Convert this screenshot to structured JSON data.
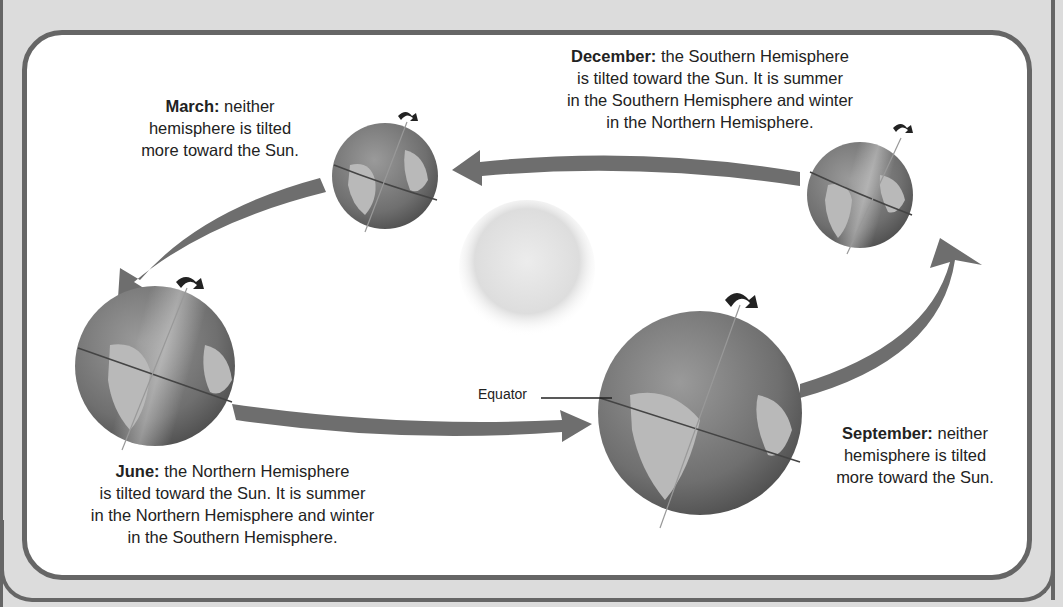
{
  "title_cut_off": "",
  "diagram": {
    "colors": {
      "frame_background": "#dcdcdc",
      "frame_border": "#666666",
      "panel_background": "#ffffff",
      "arrow": "#6e6e6e",
      "globe_ocean": "#7a7a7a",
      "globe_land": "#b9b9b9",
      "sun": "#e4e4e4",
      "text": "#222222"
    },
    "sun": {
      "label": "Sun"
    },
    "equator_label": "Equator",
    "seasons": [
      {
        "month": "March:",
        "text_lines": [
          "neither",
          "hemisphere is tilted",
          "more toward the Sun."
        ]
      },
      {
        "month": "June:",
        "text_lines": [
          "the Northern Hemisphere",
          "is tilted toward the Sun. It is summer",
          "in the Northern Hemisphere and winter",
          "in the Southern Hemisphere."
        ]
      },
      {
        "month": "September:",
        "text_lines": [
          "neither",
          "hemisphere is tilted",
          "more toward the Sun."
        ]
      },
      {
        "month": "December:",
        "text_lines": [
          "the Southern Hemisphere",
          "is tilted toward the Sun. It is summer",
          "in the Southern Hemisphere and winter",
          "in the Northern Hemisphere."
        ]
      }
    ],
    "orbit_arrows": [
      {
        "from": "December",
        "to": "March"
      },
      {
        "from": "March",
        "to": "June"
      },
      {
        "from": "June",
        "to": "September"
      },
      {
        "from": "September",
        "to": "December"
      }
    ]
  }
}
